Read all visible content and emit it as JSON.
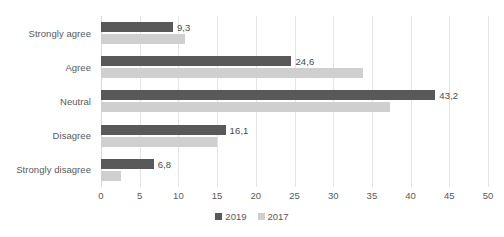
{
  "chart_data": {
    "type": "bar",
    "orientation": "horizontal",
    "title": "",
    "subtitle": "",
    "xlabel": "",
    "ylabel": "",
    "categories": [
      "Strongly agree",
      "Agree",
      "Neutral",
      "Disagree",
      "Strongly disagree"
    ],
    "series": [
      {
        "name": "2019",
        "color": "#595959",
        "values": [
          9.3,
          24.6,
          43.2,
          16.1,
          6.8
        ],
        "data_labels": [
          "9,3",
          "24,6",
          "43,2",
          "16,1",
          "6,8"
        ]
      },
      {
        "name": "2017",
        "color": "#cfcfcf",
        "values": [
          10.8,
          33.8,
          37.3,
          15.0,
          2.6
        ],
        "data_labels": [
          "",
          "",
          "",
          "",
          ""
        ]
      }
    ],
    "xlim": [
      0,
      50
    ],
    "xticks": [
      0,
      5,
      10,
      15,
      20,
      25,
      30,
      35,
      40,
      45,
      50
    ],
    "xtick_labels": [
      "0",
      "5",
      "10",
      "15",
      "20",
      "25",
      "30",
      "35",
      "40",
      "45",
      "50"
    ],
    "grid": true,
    "grid_axis": "x",
    "legend_position": "bottom",
    "legend": [
      "2019",
      "2017"
    ],
    "background_color": "#ffffff",
    "gridline_color": "#e4e4e4",
    "text_color": "#595959"
  }
}
